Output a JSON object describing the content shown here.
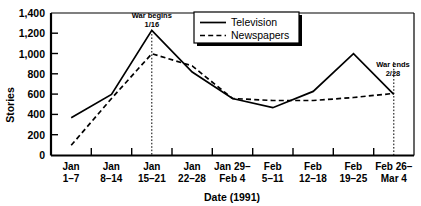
{
  "chart_data": {
    "type": "line",
    "title": "",
    "xlabel": "Date (1991)",
    "ylabel": "Stories",
    "categories": [
      "Jan 1–7",
      "Jan 8–14",
      "Jan 15–21",
      "Jan 22–28",
      "Jan 29–Feb 4",
      "Feb 5–11",
      "Feb 12–18",
      "Feb 19–25",
      "Feb 26–Mar 4"
    ],
    "category_lines": [
      [
        "Jan",
        "1–7"
      ],
      [
        "Jan",
        "8–14"
      ],
      [
        "Jan",
        "15–21"
      ],
      [
        "Jan",
        "22–28"
      ],
      [
        "Jan 29–",
        "Feb 4"
      ],
      [
        "Feb",
        "5–11"
      ],
      [
        "Feb",
        "12–18"
      ],
      [
        "Feb",
        "19–25"
      ],
      [
        "Feb 26–",
        "Mar 4"
      ]
    ],
    "series": [
      {
        "name": "Television",
        "style": "solid",
        "values": [
          370,
          600,
          1230,
          820,
          560,
          470,
          630,
          1000,
          600
        ]
      },
      {
        "name": "Newspapers",
        "style": "dashed",
        "values": [
          100,
          560,
          1000,
          880,
          560,
          540,
          540,
          570,
          610
        ]
      }
    ],
    "ylim": [
      0,
      1400
    ],
    "yticks": [
      0,
      200,
      400,
      600,
      800,
      1000,
      1200,
      1400
    ],
    "ytick_labels": [
      "0",
      "200",
      "400",
      "600",
      "800",
      "1,000",
      "1,200",
      "1,400"
    ],
    "grid": false,
    "legend_position": "top-right",
    "annotations": [
      {
        "text_lines": [
          "War begins",
          "1/16"
        ],
        "at_category": "Jan 15–21",
        "kind": "vertical-event-line"
      },
      {
        "text_lines": [
          "War ends",
          "2/28"
        ],
        "at_category": "Feb 26–Mar 4",
        "kind": "vertical-event-line"
      }
    ]
  },
  "legend": {
    "items": [
      {
        "label": "Television"
      },
      {
        "label": "Newspapers"
      }
    ]
  },
  "axes": {
    "y_title": "Stories",
    "x_title": "Date (1991)"
  },
  "colors": {
    "ink": "#000000",
    "background": "#ffffff"
  }
}
